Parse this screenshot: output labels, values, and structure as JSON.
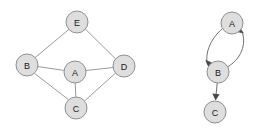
{
  "figure": {
    "background_color": "#ffffff",
    "width": 271,
    "height": 130
  },
  "style": {
    "node_fill": "#dedede",
    "node_stroke": "#8f8f8f",
    "node_radius": 11,
    "undirected_edge_color": "#9a9a9a",
    "directed_edge_color": "#6f6f6f",
    "arrow_fill": "#4a4a4a",
    "label_color": "#1a1a1a"
  },
  "graphs": [
    {
      "id": "left-graph",
      "name": "undirected-graph",
      "directed": false,
      "nodes": [
        {
          "id": "E",
          "label": "E",
          "cx": 77,
          "cy": 22
        },
        {
          "id": "B",
          "label": "B",
          "cx": 27,
          "cy": 65
        },
        {
          "id": "A",
          "label": "A",
          "cx": 75,
          "cy": 72
        },
        {
          "id": "D",
          "label": "D",
          "cx": 124,
          "cy": 66
        },
        {
          "id": "C",
          "label": "C",
          "cx": 76,
          "cy": 108
        }
      ],
      "edges": [
        {
          "from": "E",
          "to": "B"
        },
        {
          "from": "E",
          "to": "D"
        },
        {
          "from": "B",
          "to": "A"
        },
        {
          "from": "A",
          "to": "D"
        },
        {
          "from": "B",
          "to": "C"
        },
        {
          "from": "A",
          "to": "C"
        },
        {
          "from": "C",
          "to": "D"
        }
      ]
    },
    {
      "id": "right-graph",
      "name": "directed-graph",
      "directed": true,
      "nodes": [
        {
          "id": "A",
          "label": "A",
          "cx": 232,
          "cy": 23
        },
        {
          "id": "B",
          "label": "B",
          "cx": 218,
          "cy": 72
        },
        {
          "id": "C",
          "label": "C",
          "cx": 215,
          "cy": 112
        }
      ],
      "edges": [
        {
          "from": "A",
          "to": "B",
          "shape": "curve-left"
        },
        {
          "from": "B",
          "to": "A",
          "shape": "curve-right"
        },
        {
          "from": "B",
          "to": "C",
          "shape": "straight"
        }
      ]
    }
  ]
}
